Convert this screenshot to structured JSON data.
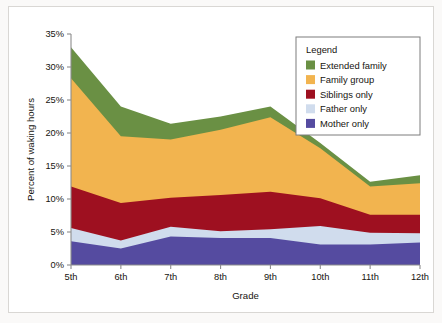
{
  "chart": {
    "type": "area",
    "legend_title": "Legend",
    "legend_position": "top-right"
  },
  "chart_data": {
    "type": "area",
    "stacked": true,
    "title": "",
    "subtitle": "",
    "xlabel": "Grade",
    "ylabel": "Percent of waking hours",
    "categories": [
      "5th",
      "6th",
      "7th",
      "8th",
      "9th",
      "10th",
      "11th",
      "12th"
    ],
    "x": [
      "5th",
      "6th",
      "7th",
      "8th",
      "9th",
      "10th",
      "11th",
      "12th"
    ],
    "xtick_labels": [
      "5th",
      "6th",
      "7th",
      "8th",
      "9th",
      "10th",
      "11th",
      "12th"
    ],
    "ytick_labels": [
      "0%",
      "5%",
      "10%",
      "15%",
      "20%",
      "25%",
      "30%",
      "35%"
    ],
    "ytick_values": [
      0,
      5,
      10,
      15,
      20,
      25,
      30,
      35
    ],
    "ylim": [
      0,
      35
    ],
    "yunit": "%",
    "grid": false,
    "legend": [
      "Extended family",
      "Family group",
      "Siblings only",
      "Father only",
      "Mother only"
    ],
    "stack_order_bottom_to_top": [
      "Mother only",
      "Father only",
      "Siblings only",
      "Family group",
      "Extended family"
    ],
    "series": [
      {
        "name": "Mother only",
        "color": "#554ba0",
        "values": [
          3.6,
          2.5,
          4.3,
          4.1,
          4.1,
          3.1,
          3.1,
          3.4
        ]
      },
      {
        "name": "Father only",
        "color": "#d0dced",
        "values": [
          2.0,
          1.2,
          1.5,
          1.0,
          1.3,
          2.8,
          1.8,
          1.4
        ]
      },
      {
        "name": "Siblings only",
        "color": "#9e1020",
        "values": [
          6.3,
          5.7,
          4.4,
          5.5,
          5.7,
          4.2,
          2.7,
          2.8
        ]
      },
      {
        "name": "Family group",
        "color": "#f2b44f",
        "values": [
          16.4,
          10.1,
          8.8,
          9.9,
          11.3,
          7.6,
          4.3,
          4.8
        ]
      },
      {
        "name": "Extended family",
        "color": "#6a9044",
        "values": [
          4.7,
          4.5,
          2.4,
          2.0,
          1.6,
          0.8,
          0.7,
          1.2
        ]
      }
    ],
    "cumulative_tops": {
      "Mother only": [
        3.6,
        2.5,
        4.3,
        4.1,
        4.1,
        3.1,
        3.1,
        3.4
      ],
      "Father only": [
        5.6,
        3.7,
        5.8,
        5.1,
        5.4,
        5.9,
        4.9,
        4.8
      ],
      "Siblings only": [
        11.9,
        9.4,
        10.2,
        10.6,
        11.1,
        10.1,
        7.6,
        7.6
      ],
      "Family group": [
        28.3,
        19.5,
        19.0,
        20.5,
        22.4,
        17.7,
        11.9,
        12.4
      ],
      "Extended family": [
        33.0,
        24.0,
        21.4,
        22.5,
        24.0,
        18.5,
        12.6,
        13.6
      ]
    },
    "totals": [
      33.0,
      24.0,
      21.4,
      22.5,
      24.0,
      18.5,
      12.6,
      13.6
    ]
  }
}
